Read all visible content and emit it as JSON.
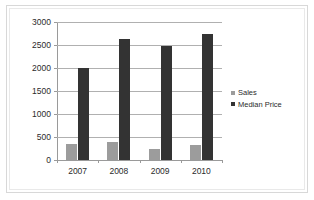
{
  "chart_data": {
    "type": "bar",
    "title": "",
    "subtitle": "",
    "xlabel": "",
    "ylabel": "",
    "categories": [
      "2007",
      "2008",
      "2009",
      "2010"
    ],
    "series": [
      {
        "name": "Sales",
        "color": "#9c9c9c",
        "values": [
          350,
          400,
          250,
          330
        ]
      },
      {
        "name": "Median Price",
        "color": "#333333",
        "values": [
          2000,
          2620,
          2470,
          2750
        ]
      }
    ],
    "ylim": [
      0,
      3000
    ],
    "yticks": [
      0,
      500,
      1000,
      1500,
      2000,
      2500,
      3000
    ],
    "ytick_labels": [
      "0",
      "500",
      "1000",
      "1500",
      "2000",
      "2500",
      "3000"
    ],
    "grid": true,
    "grid_axis": "y",
    "legend": true,
    "legend_position": "right",
    "annotations": []
  },
  "legend": {
    "entries": [
      {
        "label": "Sales",
        "color": "#9c9c9c"
      },
      {
        "label": "Median Price",
        "color": "#333333"
      }
    ]
  },
  "frame": {
    "outer_color": "#d8d8d8",
    "inner_color": "#e9e9e9"
  }
}
